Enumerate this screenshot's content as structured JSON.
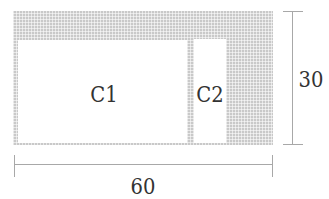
{
  "diagram": {
    "outer": {
      "x": 13,
      "y": 11,
      "w": 260,
      "h": 134
    },
    "cells": [
      {
        "id": "c1",
        "label": "C1",
        "x": 18,
        "y": 40,
        "w": 169,
        "h": 103
      },
      {
        "id": "c2",
        "label": "C2",
        "x": 194,
        "y": 39,
        "w": 32,
        "h": 104
      }
    ],
    "dimensions": {
      "width": {
        "label": "60"
      },
      "height": {
        "label": "30"
      }
    },
    "colors": {
      "hatch": "#c9c9c9",
      "line": "#a8a8a8",
      "text": "#333333"
    }
  }
}
